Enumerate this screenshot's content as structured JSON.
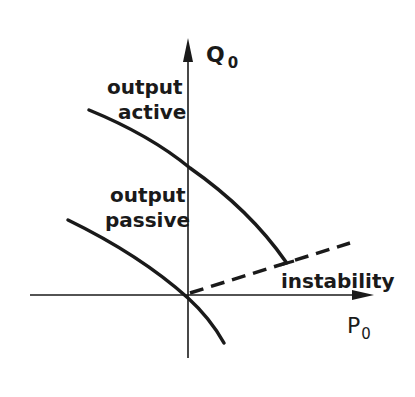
{
  "diagram": {
    "axes": {
      "x_label": "P",
      "x_sub": "0",
      "y_label": "Q",
      "y_sub": "0"
    },
    "curves": [
      {
        "name": "output-active",
        "label_line1": "output",
        "label_line2": "active",
        "style": "solid"
      },
      {
        "name": "output-passive",
        "label_line1": "output",
        "label_line2": "passive",
        "style": "solid"
      },
      {
        "name": "instability",
        "label": "instability",
        "style": "dashed"
      }
    ],
    "ink_color": "#1a1a1a"
  }
}
